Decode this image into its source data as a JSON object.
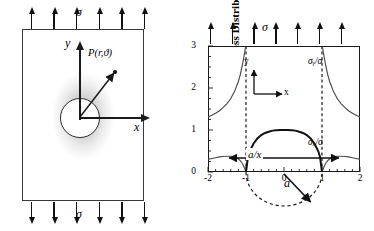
{
  "figure": {
    "left_panel": {
      "name": "plate-with-circular-hole-schematic",
      "applied_stress_label": "σ",
      "axis_x_label": "x",
      "axis_y_label": "y",
      "point_label": "P(r,ϑ)",
      "top_arrow_count": 6,
      "bottom_arrow_count": 6,
      "hole_shape": "circle"
    },
    "right_panel": {
      "name": "normalized-stress-distribution-plot",
      "applied_stress_label": "σ",
      "top_arrow_count": 7,
      "mini_axes": {
        "x": "x",
        "y": "y"
      },
      "hole_diameter_annotation": "a/x",
      "radius_annotation": "a"
    }
  },
  "chart_data": {
    "type": "line",
    "title": "",
    "ylabel": "Normalized Stress Distribution",
    "xlabel": "",
    "xlim": [
      -2,
      2
    ],
    "ylim": [
      0,
      3
    ],
    "grid": false,
    "legend": "inline-annotations",
    "xticks": [
      -2,
      -1,
      0,
      1,
      2
    ],
    "xtick_labels": [
      "-2",
      "-1",
      "0",
      "1",
      "2"
    ],
    "yticks": [
      0,
      1,
      2,
      3
    ],
    "ytick_labels": [
      "0",
      "1",
      "2",
      "3"
    ],
    "minor_ticks": true,
    "annotations": [
      {
        "text": "σᵧ/σ",
        "x": 1.45,
        "y": 2.72
      },
      {
        "text": "σₓ/σ",
        "x": 1.45,
        "y": 0.78
      },
      {
        "text": "a/x",
        "x": 0.0,
        "y": 0.28
      },
      {
        "text": "a",
        "x": 0.62,
        "y": -0.42
      },
      {
        "text": "σ",
        "x": 0.0,
        "y": 3.55
      }
    ],
    "reference_lines": [
      {
        "type": "vertical-dashed",
        "x": -1
      },
      {
        "type": "vertical-dashed",
        "x": 1
      },
      {
        "type": "dashed-semicircle",
        "center_x": 0,
        "radius": 1,
        "below_axis": true
      }
    ],
    "series": [
      {
        "name": "σᵧ/σ",
        "x": [
          -2.0,
          -1.9,
          -1.8,
          -1.7,
          -1.6,
          -1.5,
          -1.4,
          -1.3,
          -1.2,
          -1.15,
          -1.1,
          -1.06,
          -1.03,
          -1.01,
          1.01,
          1.03,
          1.06,
          1.1,
          1.15,
          1.2,
          1.3,
          1.4,
          1.5,
          1.6,
          1.7,
          1.8,
          1.9,
          2.0
        ],
        "y": [
          1.31,
          1.35,
          1.4,
          1.46,
          1.54,
          1.63,
          1.75,
          1.92,
          2.16,
          2.32,
          2.53,
          2.72,
          2.88,
          2.98,
          2.98,
          2.88,
          2.72,
          2.53,
          2.32,
          2.16,
          1.92,
          1.75,
          1.63,
          1.54,
          1.46,
          1.4,
          1.35,
          1.31
        ]
      },
      {
        "name": "σₓ/σ",
        "x": [
          -2.0,
          -1.9,
          -1.8,
          -1.7,
          -1.6,
          -1.5,
          -1.4,
          -1.35,
          -1.3,
          -1.25,
          -1.2,
          -1.15,
          -1.1,
          -1.05,
          -1.0,
          1.0,
          1.05,
          1.1,
          1.15,
          1.2,
          1.25,
          1.3,
          1.35,
          1.4,
          1.5,
          1.6,
          1.7,
          1.8,
          1.9,
          2.0
        ],
        "y": [
          0.3,
          0.32,
          0.34,
          0.36,
          0.37,
          0.375,
          0.375,
          0.37,
          0.36,
          0.34,
          0.31,
          0.27,
          0.21,
          0.12,
          0.0,
          0.0,
          0.12,
          0.21,
          0.27,
          0.31,
          0.34,
          0.36,
          0.37,
          0.375,
          0.375,
          0.37,
          0.36,
          0.34,
          0.32,
          0.3
        ]
      },
      {
        "name": "hole-edge-arch",
        "x": [
          -1.0,
          -0.95,
          -0.9,
          -0.8,
          -0.7,
          -0.6,
          -0.5,
          -0.4,
          -0.3,
          -0.2,
          -0.1,
          0.0,
          0.1,
          0.2,
          0.3,
          0.4,
          0.5,
          0.6,
          0.7,
          0.8,
          0.9,
          0.95,
          1.0
        ],
        "y": [
          0.0,
          0.35,
          0.5,
          0.68,
          0.8,
          0.88,
          0.93,
          0.96,
          0.985,
          0.995,
          1.0,
          1.0,
          1.0,
          0.995,
          0.985,
          0.96,
          0.93,
          0.88,
          0.8,
          0.68,
          0.5,
          0.35,
          0.0
        ]
      }
    ]
  }
}
